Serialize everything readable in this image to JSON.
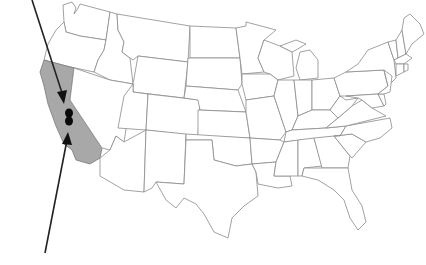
{
  "map": {
    "title": "United States map",
    "highlighted_region": "California",
    "colors": {
      "background": "#ffffff",
      "state_fill": "#ffffff",
      "state_border": "#8a8a8a",
      "highlight_fill": "#a8a8a8",
      "arrow": "#222222",
      "marker": "#0a0a0a"
    },
    "markers": [
      {
        "name": "marker-north",
        "x": 69,
        "y": 113
      },
      {
        "name": "marker-south",
        "x": 69,
        "y": 121
      }
    ],
    "arrows": [
      {
        "name": "arrow-from-top",
        "from": [
          32,
          0
        ],
        "to": [
          64,
          100
        ]
      },
      {
        "name": "arrow-from-bottom",
        "from": [
          45,
          253
        ],
        "to": [
          68,
          136
        ]
      }
    ]
  },
  "caption": {
    "text": ""
  }
}
